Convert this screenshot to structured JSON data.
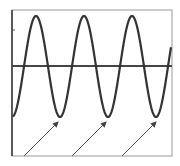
{
  "chart_data": {
    "type": "line",
    "title": "",
    "xlabel": "",
    "ylabel": "",
    "grid": false,
    "legend": null,
    "series": [
      {
        "name": "sine-wave",
        "amplitude_px": 50,
        "period_px": 48,
        "first_peak_x_px": 36,
        "peaks_x_px": [
          36,
          84,
          133
        ],
        "troughs_x_px": [
          60,
          108,
          156
        ],
        "peak_y_px": 16,
        "trough_y_px": 117,
        "axis_y_px": 66
      }
    ],
    "annotations": [
      {
        "type": "arrow",
        "points_to": "trough-1",
        "from": [
          24,
          156
        ],
        "to": [
          58,
          122
        ]
      },
      {
        "type": "arrow",
        "points_to": "trough-2",
        "from": [
          72,
          156
        ],
        "to": [
          106,
          122
        ]
      },
      {
        "type": "arrow",
        "points_to": "trough-3",
        "from": [
          122,
          156
        ],
        "to": [
          156,
          122
        ]
      }
    ],
    "frame": {
      "left": 12,
      "top": 10,
      "right": 172,
      "bottom": 156
    },
    "colors": {
      "curve": "#333333",
      "axis": "#444444",
      "frame": "#999999",
      "arrow": "#555555"
    }
  }
}
